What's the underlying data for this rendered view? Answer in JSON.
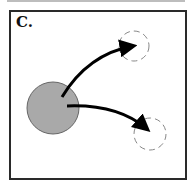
{
  "panel": {
    "label": "C.",
    "colors": {
      "source_fill": "#a9a9a9",
      "source_stroke": "#666666",
      "arrow": "#000000",
      "target_dashed": "#888888",
      "frame": "#2a2a2a"
    }
  },
  "diagram": {
    "source_circle": {
      "cx": 53,
      "cy": 108,
      "r": 26,
      "style": "solid gray fill"
    },
    "targets": [
      {
        "name": "target-upper",
        "cx": 134,
        "cy": 46,
        "r": 15,
        "style": "dashed outline"
      },
      {
        "name": "target-lower",
        "cx": 150,
        "cy": 134,
        "r": 16,
        "style": "dashed outline"
      }
    ],
    "arrows": [
      {
        "from": "source_circle",
        "to": "target-upper",
        "path": "M62 97 Q 88 54 137 45"
      },
      {
        "from": "source_circle",
        "to": "target-lower",
        "path": "M67 106 Q 118 104 151 132"
      }
    ]
  }
}
